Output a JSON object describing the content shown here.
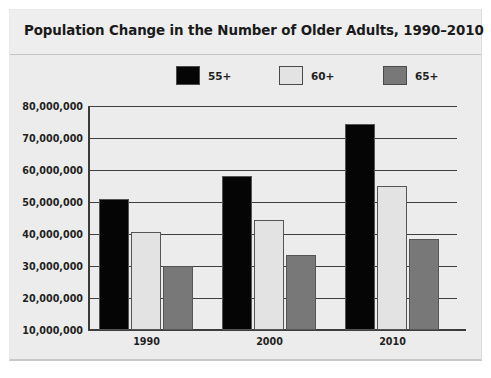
{
  "chart_data": {
    "type": "bar",
    "title": "Population Change in the Number of Older Adults, 1990–2010",
    "xlabel": "",
    "ylabel": "",
    "categories": [
      "1990",
      "2000",
      "2010"
    ],
    "series": [
      {
        "name": "55+",
        "color": "#050505",
        "values": [
          51000000,
          58000000,
          74500000
        ]
      },
      {
        "name": "60+",
        "color": "#e3e3e3",
        "values": [
          40500000,
          44500000,
          55000000
        ]
      },
      {
        "name": "65+",
        "color": "#787878",
        "values": [
          30000000,
          33500000,
          38500000
        ]
      }
    ],
    "ylim": [
      10000000,
      80000000
    ],
    "yticks": [
      10000000,
      20000000,
      30000000,
      40000000,
      50000000,
      60000000,
      70000000,
      80000000
    ],
    "ytick_labels": [
      "10,000,000",
      "20,000,000",
      "30,000,000",
      "40,000,000",
      "50,000,000",
      "60,000,000",
      "70,000,000",
      "80,000,000"
    ],
    "grid": true,
    "legend_position": "top"
  },
  "legend": {
    "entries": [
      {
        "label": "55+",
        "color": "#050505"
      },
      {
        "label": "60+",
        "color": "#e3e3e3"
      },
      {
        "label": "65+",
        "color": "#787878"
      }
    ]
  },
  "colors": {
    "card_background": "#ececec",
    "title_background": "#eeeeee",
    "axis": "#3a3a3a",
    "gridline": "#3f3f3f",
    "text": "#1f1f1f"
  }
}
